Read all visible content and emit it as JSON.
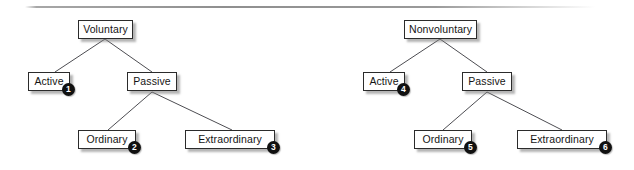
{
  "figure": {
    "background_color": "#ffffff",
    "rule_color": "#8f8f8f",
    "box_border_color": "#2b2b2b",
    "box_fill_color": "#ffffff",
    "edge_color": "#4d4d52",
    "badge_color": "#111111",
    "badge_text_color": "#ffffff"
  },
  "trees": [
    {
      "name": "voluntary-tree",
      "root": {
        "label": "Voluntary"
      },
      "nodes": [
        {
          "label": "Voluntary",
          "badge": null
        },
        {
          "label": "Active",
          "badge": "1"
        },
        {
          "label": "Passive",
          "badge": null
        },
        {
          "label": "Ordinary",
          "badge": "2"
        },
        {
          "label": "Extraordinary",
          "badge": "3"
        }
      ]
    },
    {
      "name": "nonvoluntary-tree",
      "root": {
        "label": "Nonvoluntary"
      },
      "nodes": [
        {
          "label": "Nonvoluntary",
          "badge": null
        },
        {
          "label": "Active",
          "badge": "4"
        },
        {
          "label": "Passive",
          "badge": null
        },
        {
          "label": "Ordinary",
          "badge": "5"
        },
        {
          "label": "Extraordinary",
          "badge": "6"
        }
      ]
    }
  ],
  "left": {
    "root": {
      "label": "Voluntary"
    },
    "active": {
      "label": "Active",
      "badge": "1"
    },
    "passive": {
      "label": "Passive"
    },
    "ordinary": {
      "label": "Ordinary",
      "badge": "2"
    },
    "extraordinary": {
      "label": "Extraordinary",
      "badge": "3"
    }
  },
  "right": {
    "root": {
      "label": "Nonvoluntary"
    },
    "active": {
      "label": "Active",
      "badge": "4"
    },
    "passive": {
      "label": "Passive"
    },
    "ordinary": {
      "label": "Ordinary",
      "badge": "5"
    },
    "extraordinary": {
      "label": "Extraordinary",
      "badge": "6"
    }
  }
}
